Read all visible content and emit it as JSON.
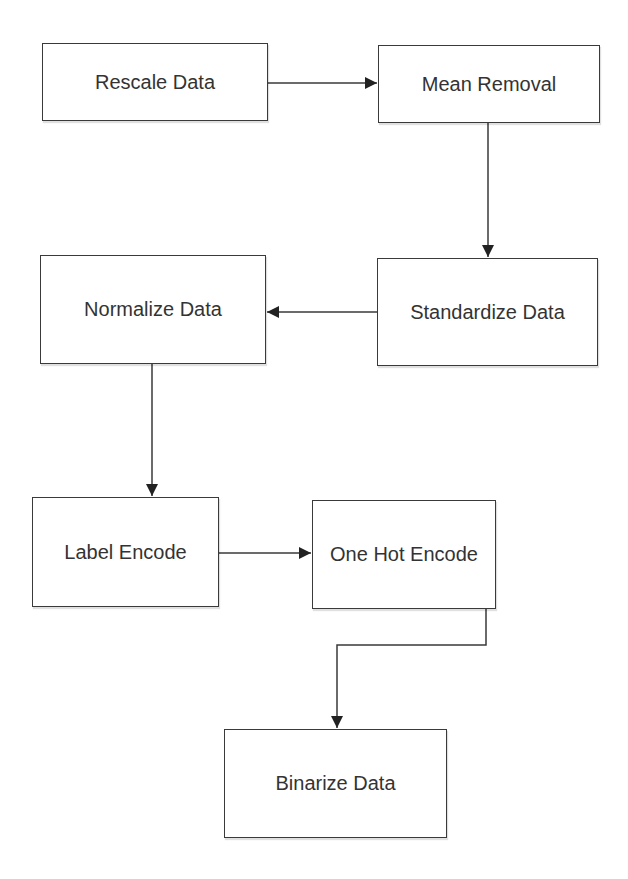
{
  "diagram": {
    "type": "flowchart",
    "nodes": [
      {
        "id": "rescale",
        "label": "Rescale Data"
      },
      {
        "id": "mean_removal",
        "label": "Mean Removal"
      },
      {
        "id": "standardize",
        "label": "Standardize Data"
      },
      {
        "id": "normalize",
        "label": "Normalize Data"
      },
      {
        "id": "label_encode",
        "label": "Label Encode"
      },
      {
        "id": "one_hot",
        "label": "One Hot Encode"
      },
      {
        "id": "binarize",
        "label": "Binarize Data"
      }
    ],
    "edges": [
      {
        "from": "rescale",
        "to": "mean_removal"
      },
      {
        "from": "mean_removal",
        "to": "standardize"
      },
      {
        "from": "standardize",
        "to": "normalize"
      },
      {
        "from": "normalize",
        "to": "label_encode"
      },
      {
        "from": "label_encode",
        "to": "one_hot"
      },
      {
        "from": "one_hot",
        "to": "binarize"
      }
    ],
    "colors": {
      "stroke": "#3a3a3a",
      "text": "#333333",
      "background": "#ffffff"
    }
  }
}
